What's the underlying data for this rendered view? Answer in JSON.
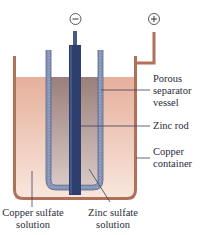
{
  "diagram": {
    "terminals": {
      "negative": "−",
      "positive": "+"
    },
    "labels": {
      "porous_separator": [
        "Porous",
        "separator",
        "vessel"
      ],
      "zinc_rod": "Zinc rod",
      "copper_container": [
        "Copper",
        "container"
      ],
      "copper_sulfate": [
        "Copper sulfate",
        "solution"
      ],
      "zinc_sulfate": [
        "Zinc sulfate",
        "solution"
      ]
    },
    "colors": {
      "copper": "#b0705a",
      "copper_solution": "#e9b8a4",
      "zinc_solution": "#a08a88",
      "zinc_rod": "#2e3f6e",
      "porous_wall": "#7f8fb0",
      "leader": "#3a3f5a"
    }
  }
}
